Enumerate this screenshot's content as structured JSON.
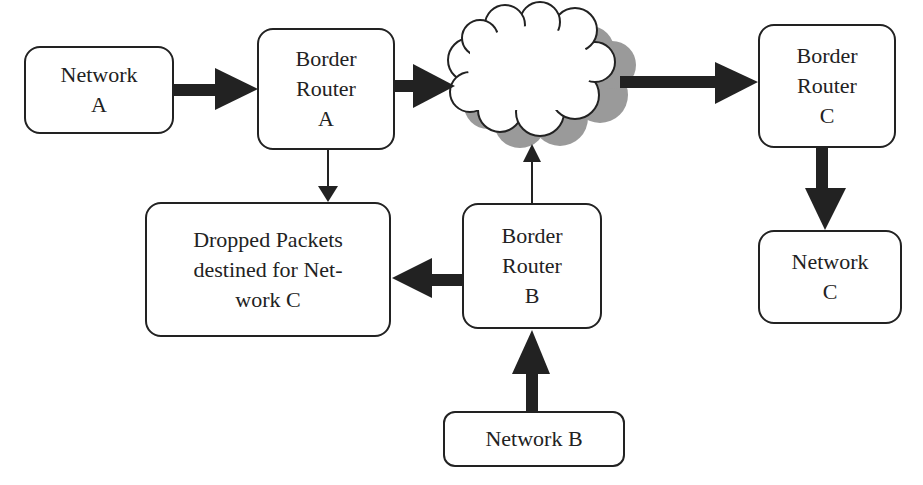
{
  "diagram": {
    "nodes": {
      "network_a": {
        "label": "Network\nA"
      },
      "border_router_a": {
        "label": "Border\nRouter\nA"
      },
      "internet_cloud": {
        "label": ""
      },
      "border_router_c": {
        "label": "Border\nRouter\nC"
      },
      "network_c": {
        "label": "Network\nC"
      },
      "dropped_packets": {
        "label": "Dropped Packets\ndestined for Net-\nwork C"
      },
      "border_router_b": {
        "label": "Border\nRouter\nB"
      },
      "network_b": {
        "label": "Network B"
      }
    },
    "edges": [
      {
        "from": "network_a",
        "to": "border_router_a",
        "weight": "thick"
      },
      {
        "from": "border_router_a",
        "to": "internet_cloud",
        "weight": "thick"
      },
      {
        "from": "border_router_a",
        "to": "dropped_packets",
        "weight": "thin"
      },
      {
        "from": "internet_cloud",
        "to": "border_router_c",
        "weight": "thick"
      },
      {
        "from": "border_router_c",
        "to": "network_c",
        "weight": "thick"
      },
      {
        "from": "border_router_b",
        "to": "internet_cloud",
        "weight": "thin"
      },
      {
        "from": "border_router_b",
        "to": "dropped_packets",
        "weight": "thick"
      },
      {
        "from": "network_b",
        "to": "border_router_b",
        "weight": "thick"
      }
    ],
    "colors": {
      "stroke": "#222222",
      "cloud_shadow": "#9a9a9a",
      "fill": "#ffffff"
    }
  }
}
